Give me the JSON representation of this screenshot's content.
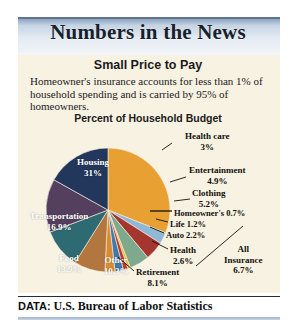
{
  "header": {
    "title": "Numbers in the News"
  },
  "article": {
    "subtitle": "Small Price to Pay",
    "blurb": "Homeowner's insurance accounts for less than 1% of household spending and is carried by 95% of homeowners.",
    "chart_title": "Percent of Household Budget"
  },
  "annotations": {
    "all_insurance_name": "All",
    "all_insurance_name2": "Insurance",
    "all_insurance_value": "6.7%"
  },
  "footer": {
    "label": "DATA:",
    "source": "U.S. Bureau of Labor Statistics"
  },
  "chart_data": {
    "type": "pie",
    "title": "Percent of Household Budget",
    "unit": "percent",
    "legend": "none",
    "start_angle_deg": -90,
    "direction": "clockwise",
    "categories": [
      "Housing",
      "Health care",
      "Entertainment",
      "Clothing",
      "Homeowner's",
      "Life",
      "Auto",
      "Health",
      "Retirement",
      "Other",
      "Food",
      "Transportation"
    ],
    "values": [
      31,
      3,
      4.9,
      5.2,
      0.7,
      1.2,
      2.2,
      2.6,
      8.1,
      10.3,
      13.9,
      16.9
    ],
    "colors": [
      "#e8a033",
      "#8fb8d6",
      "#a5362f",
      "#7fa98c",
      "#f0c02a",
      "#c0392b",
      "#3f79ae",
      "#d98b33",
      "#b3763f",
      "#2e6a72",
      "#54405e",
      "#23375c"
    ],
    "slices": [
      {
        "label": "Housing",
        "value": 31,
        "value_text": "31%",
        "color": "#e8a033",
        "label_placement": "inside"
      },
      {
        "label": "Health care",
        "value": 3,
        "value_text": "3%",
        "color": "#8fb8d6",
        "label_placement": "outside"
      },
      {
        "label": "Entertainment",
        "value": 4.9,
        "value_text": "4.9%",
        "color": "#a5362f",
        "label_placement": "outside"
      },
      {
        "label": "Clothing",
        "value": 5.2,
        "value_text": "5.2%",
        "color": "#7fa98c",
        "label_placement": "outside"
      },
      {
        "label": "Homeowner's",
        "value": 0.7,
        "value_text": "0.7%",
        "color": "#f0c02a",
        "label_placement": "outside",
        "group": "All Insurance"
      },
      {
        "label": "Life",
        "value": 1.2,
        "value_text": "1.2%",
        "color": "#c0392b",
        "label_placement": "outside",
        "group": "All Insurance"
      },
      {
        "label": "Auto",
        "value": 2.2,
        "value_text": "2.2%",
        "color": "#3f79ae",
        "label_placement": "outside",
        "group": "All Insurance"
      },
      {
        "label": "Health",
        "value": 2.6,
        "value_text": "2.6%",
        "color": "#d98b33",
        "label_placement": "outside",
        "group": "All Insurance"
      },
      {
        "label": "Retirement",
        "value": 8.1,
        "value_text": "8.1%",
        "color": "#b3763f",
        "label_placement": "outside"
      },
      {
        "label": "Other",
        "value": 10.3,
        "value_text": "10.3%",
        "color": "#2e6a72",
        "label_placement": "inside"
      },
      {
        "label": "Food",
        "value": 13.9,
        "value_text": "13.9%",
        "color": "#54405e",
        "label_placement": "inside"
      },
      {
        "label": "Transportation",
        "value": 16.9,
        "value_text": "16.9%",
        "color": "#23375c",
        "label_placement": "inside"
      }
    ],
    "groups": [
      {
        "name": "All Insurance",
        "value": 6.7,
        "value_text": "6.7%",
        "members": [
          "Homeowner's",
          "Life",
          "Auto",
          "Health"
        ]
      }
    ]
  }
}
